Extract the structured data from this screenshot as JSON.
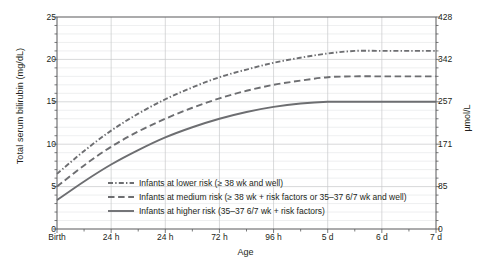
{
  "chart_data": {
    "type": "line",
    "title": "",
    "xlabel": "Age",
    "ylabel": "Total serum bilirubin (mg/dL)",
    "ylabel_right": "µmol/L",
    "grid": true,
    "legend_position": "inside-bottom-left",
    "x_categories": [
      "Birth",
      "24 h",
      "24 h",
      "72 h",
      "96 h",
      "5 d",
      "6 d",
      "7 d"
    ],
    "x_values": [
      0,
      1,
      2,
      3,
      4,
      5,
      6,
      7
    ],
    "xlim": [
      0,
      7
    ],
    "ylim": [
      0,
      25
    ],
    "yticks": [
      0,
      5,
      10,
      15,
      20,
      25
    ],
    "yticks_right": [
      0,
      85,
      171,
      257,
      342,
      428
    ],
    "series": [
      {
        "name": "Infants at lower risk (≥ 38 wk and well)",
        "style": "dash-dot",
        "color": "#6d6e71",
        "x": [
          0,
          0.5,
          1,
          1.5,
          2,
          2.5,
          3,
          3.5,
          4,
          4.5,
          5,
          5.5,
          6,
          6.5,
          7
        ],
        "values": [
          6.5,
          9.2,
          11.6,
          13.6,
          15.3,
          16.7,
          17.9,
          18.8,
          19.6,
          20.2,
          20.7,
          21.0,
          21.0,
          21.0,
          21.0
        ]
      },
      {
        "name": "Infants at medium risk (≥ 38 wk + risk factors or 35–37 6/7 wk and well)",
        "style": "dashed",
        "color": "#6d6e71",
        "x": [
          0,
          0.5,
          1,
          1.5,
          2,
          2.5,
          3,
          3.5,
          4,
          4.5,
          5,
          5.5,
          6,
          6.5,
          7
        ],
        "values": [
          5.0,
          7.5,
          9.7,
          11.5,
          13.0,
          14.3,
          15.4,
          16.3,
          17.0,
          17.5,
          17.9,
          18.0,
          18.0,
          18.0,
          18.0
        ]
      },
      {
        "name": "Infants at higher risk (35–37 6/7 wk + risk factors)",
        "style": "solid",
        "color": "#6d6e71",
        "x": [
          0,
          0.5,
          1,
          1.5,
          2,
          2.5,
          3,
          3.5,
          4,
          4.5,
          5,
          5.5,
          6,
          6.5,
          7
        ],
        "values": [
          3.4,
          5.6,
          7.6,
          9.3,
          10.8,
          12.0,
          13.0,
          13.8,
          14.4,
          14.8,
          15.0,
          15.0,
          15.0,
          15.0,
          15.0
        ]
      }
    ]
  },
  "legend": {
    "items": [
      {
        "label": "Infants at lower risk (≥ 38 wk and well)",
        "style": "dash-dot"
      },
      {
        "label": "Infants at medium risk (≥ 38 wk + risk factors or 35–37 6/7 wk and well)",
        "style": "dashed"
      },
      {
        "label": "Infants at higher risk (35–37 6/7 wk + risk factors)",
        "style": "solid"
      }
    ]
  },
  "colors": {
    "line": "#6d6e71",
    "axis": "#58595b",
    "grid_major": "#c7c8ca",
    "grid_minor": "#e3e4e5",
    "text": "#231f20",
    "background": "#ffffff"
  }
}
